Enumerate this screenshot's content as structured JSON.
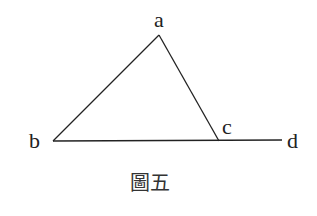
{
  "figure": {
    "caption": "圖五",
    "points": {
      "a": {
        "label": "a",
        "x": 159,
        "y": 35
      },
      "b": {
        "label": "b",
        "x": 53,
        "y": 141
      },
      "c": {
        "label": "c",
        "x": 219,
        "y": 141
      },
      "d": {
        "label": "d",
        "x": 282,
        "y": 140
      }
    },
    "segments": [
      "ab",
      "ac",
      "bc",
      "cd"
    ],
    "line_color": "#222222"
  }
}
